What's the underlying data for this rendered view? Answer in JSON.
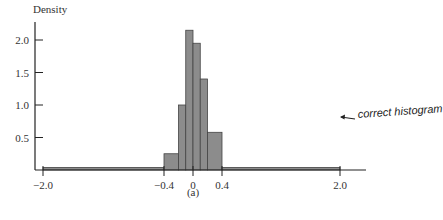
{
  "chart_data": {
    "type": "bar",
    "title": "",
    "xlabel": "",
    "ylabel": "Density",
    "caption": "(a)",
    "bins": [
      {
        "left": -2.0,
        "right": -0.4,
        "density": 0.04
      },
      {
        "left": -0.4,
        "right": -0.2,
        "density": 0.25
      },
      {
        "left": -0.2,
        "right": -0.1,
        "density": 1.0
      },
      {
        "left": -0.1,
        "right": 0.0,
        "density": 2.15
      },
      {
        "left": 0.0,
        "right": 0.1,
        "density": 1.95
      },
      {
        "left": 0.1,
        "right": 0.2,
        "density": 1.4
      },
      {
        "left": 0.2,
        "right": 0.4,
        "density": 0.58
      },
      {
        "left": 0.4,
        "right": 2.0,
        "density": 0.04
      }
    ],
    "x_ticks": [
      "-2.0",
      "-0.4",
      "0",
      "0.4",
      "2.0"
    ],
    "y_ticks": [
      "0.5",
      "1.0",
      "1.5",
      "2.0"
    ],
    "ylim": [
      0,
      2.2
    ],
    "xlim": [
      -2.1,
      2.3
    ],
    "grid": false,
    "annotation": "correct histogram",
    "bar_color": "#8c8c8c",
    "edge_color": "#444444"
  }
}
